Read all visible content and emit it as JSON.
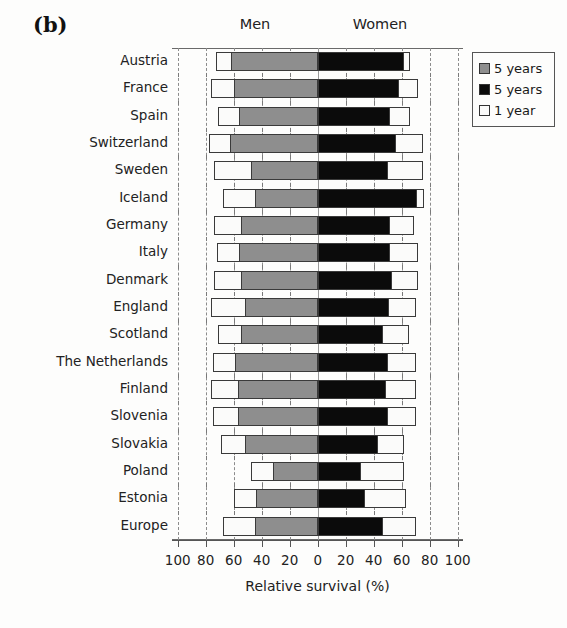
{
  "figure": {
    "panel_label": "(b)",
    "header_men": "Men",
    "header_women": "Women",
    "xaxis_title": "Relative survival (%)"
  },
  "legend": {
    "items": [
      {
        "label": "5 years",
        "color": "#8e8e8e",
        "swatch": "gray-swatch"
      },
      {
        "label": "5 years",
        "color": "#0b0b0b",
        "swatch": "black-swatch"
      },
      {
        "label": "1 year",
        "color": "#fbfbfa",
        "swatch": "white-swatch"
      }
    ]
  },
  "chart_data": {
    "type": "bar",
    "subtype": "diverging-stacked-horizontal",
    "title": "(b)",
    "xlabel": "Relative survival (%)",
    "ylabel": "",
    "xlim": [
      -100,
      100
    ],
    "xticks": [
      -100,
      -80,
      -60,
      -40,
      -20,
      0,
      20,
      40,
      60,
      80,
      100
    ],
    "xticklabels": [
      "100",
      "80",
      "60",
      "40",
      "20",
      "0",
      "20",
      "40",
      "60",
      "80",
      "100"
    ],
    "grid": "vertical-dashed",
    "legend_position": "right",
    "group_labels": [
      "Men",
      "Women"
    ],
    "categories": [
      "Austria",
      "France",
      "Spain",
      "Switzerland",
      "Sweden",
      "Iceland",
      "Germany",
      "Italy",
      "Denmark",
      "England",
      "Scotland",
      "The Netherlands",
      "Finland",
      "Slovenia",
      "Slovakia",
      "Poland",
      "Estonia",
      "Europe"
    ],
    "series": [
      {
        "name": "Men 1 year",
        "side": "left",
        "color": "#fbfbfa",
        "values": [
          73,
          76,
          71,
          78,
          74,
          68,
          74,
          72,
          74,
          76,
          71,
          75,
          76,
          75,
          69,
          48,
          60,
          68
        ]
      },
      {
        "name": "Men 5 years",
        "side": "left",
        "color": "#8e8e8e",
        "values": [
          62,
          60,
          56,
          63,
          48,
          45,
          55,
          56,
          55,
          52,
          55,
          59,
          57,
          57,
          52,
          32,
          44,
          45
        ]
      },
      {
        "name": "Women 5 years",
        "side": "right",
        "color": "#0b0b0b",
        "values": [
          62,
          58,
          52,
          56,
          50,
          71,
          52,
          52,
          53,
          51,
          47,
          50,
          49,
          50,
          43,
          31,
          34,
          47
        ]
      },
      {
        "name": "Women 1 year",
        "side": "right",
        "color": "#fbfbfa",
        "values": [
          66,
          72,
          66,
          75,
          75,
          76,
          69,
          72,
          72,
          70,
          65,
          70,
          70,
          70,
          62,
          62,
          63,
          70
        ]
      }
    ]
  }
}
